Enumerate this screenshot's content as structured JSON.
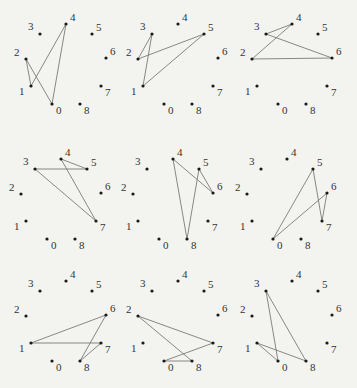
{
  "figure": {
    "background": "#f3f3f0",
    "edge_color": "#7a7a7a",
    "dot_color": "#1a1a1a",
    "base_points": {
      "0": [
        52,
        104
      ],
      "1": [
        31,
        86
      ],
      "2": [
        26,
        59
      ],
      "3": [
        40,
        34
      ],
      "4": [
        66,
        24
      ],
      "5": [
        92,
        34
      ],
      "6": [
        106,
        58
      ],
      "7": [
        101,
        86
      ],
      "8": [
        80,
        104
      ]
    },
    "label_offsets": {
      "0": [
        4,
        10
      ],
      "1": [
        -12,
        9
      ],
      "2": [
        -12,
        -3
      ],
      "3": [
        -12,
        -4
      ],
      "4": [
        4,
        -3
      ],
      "5": [
        4,
        -3
      ],
      "6": [
        4,
        -3
      ],
      "7": [
        4,
        10
      ],
      "8": [
        4,
        10
      ]
    },
    "panels": [
      {
        "id": 1,
        "offset": [
          0,
          0
        ],
        "cycle": [
          2,
          1,
          4,
          0
        ]
      },
      {
        "id": 2,
        "offset": [
          112,
          0
        ],
        "cycle": [
          3,
          2,
          5,
          1
        ]
      },
      {
        "id": 3,
        "offset": [
          226,
          0
        ],
        "cycle": [
          3,
          4,
          2,
          6
        ]
      },
      {
        "id": 4,
        "offset": [
          -5,
          135
        ],
        "cycle": [
          4,
          5,
          3,
          7
        ]
      },
      {
        "id": 5,
        "offset": [
          107,
          135
        ],
        "cycle": [
          4,
          6,
          5,
          8
        ]
      },
      {
        "id": 6,
        "offset": [
          221,
          135
        ],
        "cycle": [
          5,
          7,
          6,
          0
        ]
      },
      {
        "id": 7,
        "offset": [
          0,
          257
        ],
        "cycle": [
          6,
          1,
          7,
          8
        ]
      },
      {
        "id": 8,
        "offset": [
          112,
          257
        ],
        "cycle": [
          2,
          7,
          0,
          8
        ]
      },
      {
        "id": 9,
        "offset": [
          226,
          257
        ],
        "cycle": [
          3,
          0,
          1,
          8
        ]
      }
    ],
    "point_labels": [
      "0",
      "1",
      "2",
      "3",
      "4",
      "5",
      "6",
      "7",
      "8"
    ]
  }
}
